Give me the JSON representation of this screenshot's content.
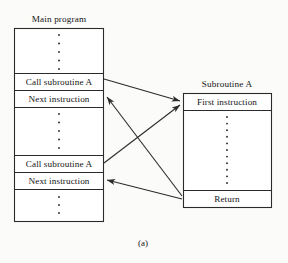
{
  "figure": {
    "caption": "(a)",
    "background_color": "#fbfbfa",
    "line_color": "#2b2b2b"
  },
  "main_program": {
    "title": "Main program",
    "rows": [
      {
        "type": "ellipsis",
        "label": "",
        "dots": 5
      },
      {
        "type": "instruction",
        "label": "Call subroutine A",
        "dots": 0
      },
      {
        "type": "instruction",
        "label": "Next instruction",
        "dots": 0
      },
      {
        "type": "ellipsis",
        "label": "",
        "dots": 5
      },
      {
        "type": "instruction",
        "label": "Call subroutine A",
        "dots": 0
      },
      {
        "type": "instruction",
        "label": "Next instruction",
        "dots": 0
      },
      {
        "type": "ellipsis",
        "label": "",
        "dots": 4
      }
    ]
  },
  "subroutine": {
    "title": "Subroutine A",
    "rows": [
      {
        "type": "instruction",
        "label": "First instruction",
        "dots": 0
      },
      {
        "type": "ellipsis",
        "label": "",
        "dots": 12
      },
      {
        "type": "instruction",
        "label": "Return",
        "dots": 0
      }
    ]
  },
  "arrows": [
    {
      "name": "call-1-to-first-instruction",
      "from": "Call subroutine A (1)",
      "to": "First instruction"
    },
    {
      "name": "return-to-next-instruction-1",
      "from": "Return",
      "to": "Next instruction (1)"
    },
    {
      "name": "call-2-to-first-instruction",
      "from": "Call subroutine A (2)",
      "to": "First instruction"
    },
    {
      "name": "return-to-next-instruction-2",
      "from": "Return",
      "to": "Next instruction (2)"
    }
  ]
}
